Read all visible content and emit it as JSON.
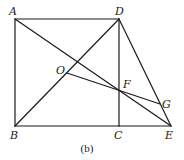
{
  "diagram": {
    "caption": "(b)",
    "points": {
      "A": {
        "label": "A"
      },
      "B": {
        "label": "B"
      },
      "C": {
        "label": "C"
      },
      "D": {
        "label": "D"
      },
      "E": {
        "label": "E"
      },
      "F": {
        "label": "F"
      },
      "G": {
        "label": "G"
      },
      "O": {
        "label": "O"
      }
    },
    "segments": [
      [
        "A",
        "D"
      ],
      [
        "A",
        "B"
      ],
      [
        "B",
        "C"
      ],
      [
        "C",
        "E"
      ],
      [
        "D",
        "C"
      ],
      [
        "B",
        "D"
      ],
      [
        "A",
        "E"
      ],
      [
        "D",
        "E"
      ],
      [
        "O",
        "G"
      ]
    ]
  }
}
